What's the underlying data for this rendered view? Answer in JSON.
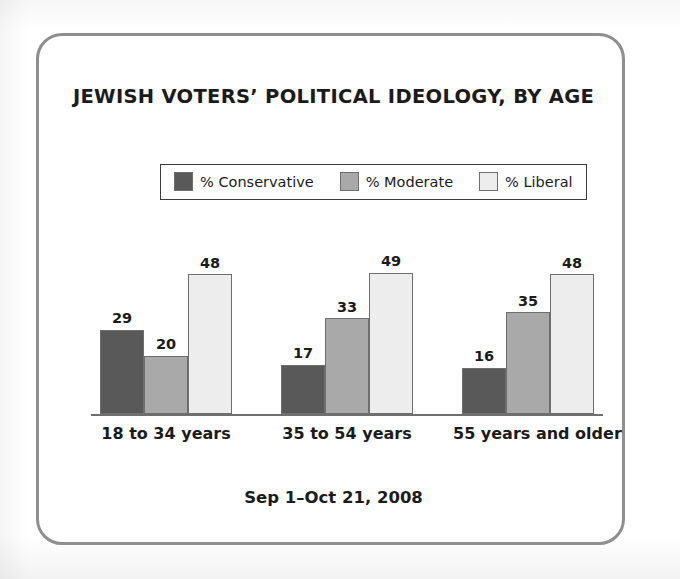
{
  "chart_data": {
    "type": "bar",
    "title": "JEWISH VOTERS’ POLITICAL IDEOLOGY, BY AGE",
    "footer": "Sep 1–Oct 21, 2008",
    "xlabel": "",
    "ylabel": "",
    "ylim": [
      0,
      55
    ],
    "grid": false,
    "legend_position": "top-center",
    "categories": [
      "18 to 34 years",
      "35 to 54 years",
      "55 years and older"
    ],
    "series": [
      {
        "name": "% Conservative",
        "color": "#595959",
        "values": [
          29,
          17,
          16
        ]
      },
      {
        "name": "% Moderate",
        "color": "#a9a9a9",
        "values": [
          20,
          33,
          35
        ]
      },
      {
        "name": "% Liberal",
        "color": "#ededed",
        "values": [
          48,
          49,
          48
        ]
      }
    ],
    "groups": [
      {
        "category": "18 to 34 years",
        "bars": [
          {
            "series": "% Conservative",
            "value": 29,
            "label": "29",
            "color": "#595959"
          },
          {
            "series": "% Moderate",
            "value": 20,
            "label": "20",
            "color": "#a9a9a9"
          },
          {
            "series": "% Liberal",
            "value": 48,
            "label": "48",
            "color": "#ededed"
          }
        ]
      },
      {
        "category": "35 to 54 years",
        "bars": [
          {
            "series": "% Conservative",
            "value": 17,
            "label": "17",
            "color": "#595959"
          },
          {
            "series": "% Moderate",
            "value": 33,
            "label": "33",
            "color": "#a9a9a9"
          },
          {
            "series": "% Liberal",
            "value": 49,
            "label": "49",
            "color": "#ededed"
          }
        ]
      },
      {
        "category": "55 years and older",
        "bars": [
          {
            "series": "% Conservative",
            "value": 16,
            "label": "16",
            "color": "#595959"
          },
          {
            "series": "% Moderate",
            "value": 35,
            "label": "35",
            "color": "#a9a9a9"
          },
          {
            "series": "% Liberal",
            "value": 48,
            "label": "48",
            "color": "#ededed"
          }
        ]
      }
    ]
  },
  "frame": {
    "border_color": "#8f8f8f",
    "background": "#ffffff"
  },
  "axis": {
    "line_color": "#6f6f6f"
  }
}
